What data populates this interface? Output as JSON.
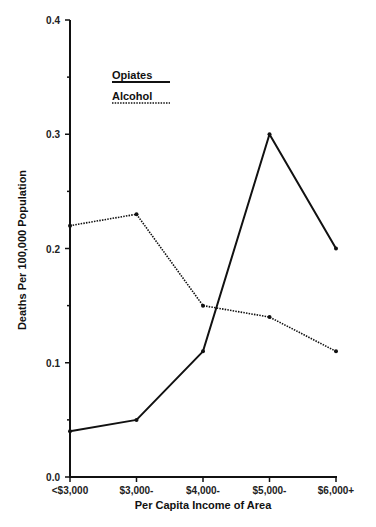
{
  "chart_data": {
    "type": "line",
    "title": "",
    "xlabel": "Per Capita Income of Area",
    "ylabel": "Deaths Per 100,000 Population",
    "categories": [
      "<$3,000",
      "$3,000-",
      "$4,000-",
      "$5,000-",
      "$6,000+"
    ],
    "yticks": [
      "0.0",
      "0.1",
      "0.2",
      "0.3",
      "0.4"
    ],
    "ylim": [
      0,
      0.4
    ],
    "grid": false,
    "legend_position": "upper-left inside plot",
    "series": [
      {
        "name": "Opiates",
        "style": "solid",
        "values": [
          0.04,
          0.05,
          0.11,
          0.3,
          0.2
        ]
      },
      {
        "name": "Alcohol",
        "style": "dotted",
        "values": [
          0.22,
          0.23,
          0.15,
          0.14,
          0.11
        ]
      }
    ]
  },
  "legend": {
    "items": [
      {
        "label": "Opiates"
      },
      {
        "label": "Alcohol"
      }
    ]
  },
  "colors": {
    "line": "#111111",
    "background": "#ffffff"
  }
}
